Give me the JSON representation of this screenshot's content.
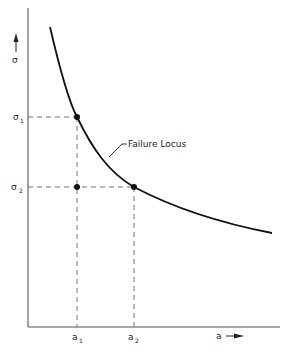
{
  "diagram": {
    "title": "",
    "y_axis": {
      "symbol": "σ",
      "arrow": "up"
    },
    "x_axis": {
      "symbol": "a",
      "arrow": "right"
    },
    "curve_label": "Failure Locus",
    "y_ticks": [
      {
        "base": "σ",
        "sub": "1"
      },
      {
        "base": "σ",
        "sub": "2"
      }
    ],
    "x_ticks": [
      {
        "base": "a",
        "sub": "1"
      },
      {
        "base": "a",
        "sub": "2"
      }
    ],
    "points": [
      {
        "name": "(a1, σ1) on failure locus"
      },
      {
        "name": "(a2, σ2) on failure locus"
      },
      {
        "name": "(a1, σ2) below failure locus"
      }
    ]
  }
}
